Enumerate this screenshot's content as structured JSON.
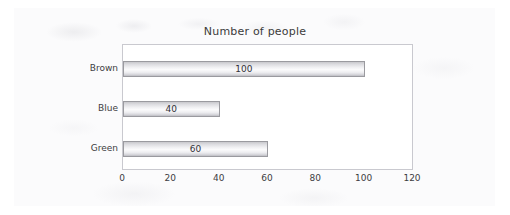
{
  "chart_data": {
    "type": "bar",
    "orientation": "horizontal",
    "title": "Number of people",
    "xlabel": "",
    "ylabel": "",
    "categories": [
      "Brown",
      "Blue",
      "Green"
    ],
    "values": [
      100,
      40,
      60
    ],
    "data_labels": [
      "100",
      "40",
      "60"
    ],
    "xticks": [
      "0",
      "20",
      "40",
      "60",
      "80",
      "100",
      "120"
    ],
    "xtick_values": [
      0,
      20,
      40,
      60,
      80,
      100,
      120
    ],
    "xlim": [
      0,
      120
    ],
    "grid": false,
    "legend": false,
    "series": [
      {
        "name": "Number of people",
        "values": [
          100,
          40,
          60
        ]
      }
    ],
    "colors": {
      "bar_fill_light": "#fbfbfc",
      "bar_fill_mid": "#dcdce0",
      "bar_border": "#9a9a9f",
      "plot_border": "#c9c9cf",
      "plot_background": "#ffffff",
      "text": "#3d3d42",
      "page_background": "#fbfbfc"
    }
  }
}
